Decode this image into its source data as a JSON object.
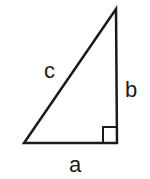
{
  "diagram": {
    "labels": {
      "hypotenuse": "c",
      "vertical_leg": "b",
      "horizontal_leg": "a"
    },
    "right_angle_marker": true,
    "stroke_color": "#1a1a1a",
    "background": "#ffffff"
  }
}
